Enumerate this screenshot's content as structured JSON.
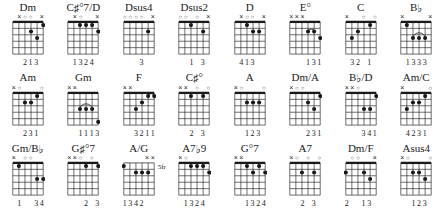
{
  "meta": {
    "doc_type": "guitar-chord-chart",
    "rows": 3,
    "cols": 8,
    "strings": 6,
    "frets": 5,
    "ink_color": "#1a1a1a",
    "background_color": "#ffffff"
  },
  "symbols": {
    "open": "○",
    "muted": "×",
    "dot": "●"
  },
  "chart_data": {
    "type": "table",
    "title": "",
    "chords": [
      {
        "name": "Dm",
        "name_parts": [
          {
            "t": "Dm",
            "k": "plain"
          }
        ],
        "position_label": "",
        "markers": [
          "n",
          "x",
          "o",
          "o",
          "n",
          "x"
        ],
        "dots": [
          {
            "string": 3,
            "fret": 2
          },
          {
            "string": 2,
            "fret": 3
          },
          {
            "string": 1,
            "fret": 1
          }
        ],
        "barres": [],
        "fingering": [
          "",
          "",
          "2",
          "1",
          "3",
          ""
        ]
      },
      {
        "name": "C#°7/D",
        "name_parts": [
          {
            "t": "C",
            "k": "plain"
          },
          {
            "t": "♯",
            "k": "acc"
          },
          {
            "t": "°7",
            "k": "plain"
          },
          {
            "t": "/D",
            "k": "plain"
          }
        ],
        "position_label": "",
        "markers": [
          "n",
          "x",
          "o",
          "n",
          "n",
          "x"
        ],
        "dots": [
          {
            "string": 4,
            "fret": 1
          },
          {
            "string": 3,
            "fret": 1
          },
          {
            "string": 2,
            "fret": 1
          },
          {
            "string": 1,
            "fret": 2
          }
        ],
        "barres": [],
        "fingering": [
          "",
          "1",
          "3",
          "2",
          "4",
          ""
        ]
      },
      {
        "name": "Dsus4",
        "name_parts": [
          {
            "t": "Dsus4",
            "k": "plain"
          }
        ],
        "position_label": "",
        "markers": [
          "o",
          "o",
          "o",
          "o",
          "n",
          "x"
        ],
        "dots": [
          {
            "string": 2,
            "fret": 2
          }
        ],
        "barres": [],
        "fingering": [
          "",
          "",
          "",
          "3",
          "",
          ""
        ]
      },
      {
        "name": "Dsus2",
        "name_parts": [
          {
            "t": "Dsus2",
            "k": "plain"
          }
        ],
        "position_label": "",
        "markers": [
          "o",
          "o",
          "n",
          "o",
          "n",
          "x"
        ],
        "dots": [
          {
            "string": 4,
            "fret": 1
          },
          {
            "string": 2,
            "fret": 2
          }
        ],
        "barres": [],
        "fingering": [
          "",
          "",
          "1",
          "",
          "3",
          ""
        ]
      },
      {
        "name": "D",
        "name_parts": [
          {
            "t": "D",
            "k": "plain"
          }
        ],
        "position_label": "",
        "markers": [
          "n",
          "x",
          "o",
          "o",
          "n",
          "x"
        ],
        "dots": [
          {
            "string": 4,
            "fret": 1
          },
          {
            "string": 3,
            "fret": 2
          },
          {
            "string": 2,
            "fret": 2
          }
        ],
        "barres": [],
        "fingering": [
          "",
          "4",
          "1",
          "3",
          "",
          ""
        ]
      },
      {
        "name": "E°",
        "name_parts": [
          {
            "t": "E",
            "k": "plain"
          },
          {
            "t": "°",
            "k": "plain"
          }
        ],
        "position_label": "",
        "markers": [
          "x",
          "x",
          "x",
          "n",
          "n",
          "n"
        ],
        "dots": [
          {
            "string": 3,
            "fret": 2
          },
          {
            "string": 2,
            "fret": 2
          },
          {
            "string": 1,
            "fret": 3
          }
        ],
        "barres": [
          {
            "fret": 2,
            "from": 3,
            "to": 2,
            "arc": true
          }
        ],
        "fingering": [
          "",
          "",
          "",
          "1",
          "3",
          "1"
        ]
      },
      {
        "name": "C",
        "name_parts": [
          {
            "t": "C",
            "k": "plain"
          }
        ],
        "position_label": "",
        "markers": [
          "x",
          "n",
          "n",
          "o",
          "n",
          "o"
        ],
        "dots": [
          {
            "string": 5,
            "fret": 3
          },
          {
            "string": 4,
            "fret": 2
          },
          {
            "string": 2,
            "fret": 1
          }
        ],
        "barres": [],
        "fingering": [
          "",
          "3",
          "2",
          "",
          "1",
          ""
        ]
      },
      {
        "name": "B♭",
        "name_parts": [
          {
            "t": "B",
            "k": "plain"
          },
          {
            "t": "♭",
            "k": "acc"
          }
        ],
        "position_label": "",
        "markers": [
          "x",
          "n",
          "n",
          "n",
          "n",
          "x"
        ],
        "dots": [
          {
            "string": 5,
            "fret": 1
          },
          {
            "string": 4,
            "fret": 3
          },
          {
            "string": 3,
            "fret": 3
          },
          {
            "string": 2,
            "fret": 3
          }
        ],
        "barres": [
          {
            "fret": 3,
            "from": 4,
            "to": 2,
            "arc": true
          }
        ],
        "fingering": [
          "",
          "1",
          "3",
          "3",
          "3",
          ""
        ]
      },
      {
        "name": "Am",
        "name_parts": [
          {
            "t": "Am",
            "k": "plain"
          }
        ],
        "position_label": "",
        "markers": [
          "x",
          "o",
          "n",
          "n",
          "n",
          "o"
        ],
        "dots": [
          {
            "string": 4,
            "fret": 2
          },
          {
            "string": 3,
            "fret": 2
          },
          {
            "string": 2,
            "fret": 1
          }
        ],
        "barres": [],
        "fingering": [
          "",
          "",
          "2",
          "3",
          "1",
          ""
        ]
      },
      {
        "name": "Gm",
        "name_parts": [
          {
            "t": "Gm",
            "k": "plain"
          }
        ],
        "position_label": "",
        "markers": [
          "x",
          "x",
          "n",
          "n",
          "n",
          "n"
        ],
        "dots": [
          {
            "string": 4,
            "fret": 3
          },
          {
            "string": 3,
            "fret": 3
          },
          {
            "string": 2,
            "fret": 3
          },
          {
            "string": 1,
            "fret": 5
          }
        ],
        "barres": [
          {
            "fret": 3,
            "from": 4,
            "to": 2,
            "arc": true
          }
        ],
        "fingering": [
          "",
          "",
          "1",
          "1",
          "1",
          "3"
        ]
      },
      {
        "name": "F",
        "name_parts": [
          {
            "t": "F",
            "k": "plain"
          }
        ],
        "position_label": "",
        "markers": [
          "x",
          "x",
          "n",
          "n",
          "n",
          "n"
        ],
        "dots": [
          {
            "string": 4,
            "fret": 3
          },
          {
            "string": 3,
            "fret": 2
          },
          {
            "string": 2,
            "fret": 1
          },
          {
            "string": 1,
            "fret": 1
          }
        ],
        "barres": [
          {
            "fret": 1,
            "from": 2,
            "to": 1,
            "arc": true
          }
        ],
        "fingering": [
          "",
          "",
          "3",
          "2",
          "1",
          "1"
        ]
      },
      {
        "name": "C#°",
        "name_parts": [
          {
            "t": "C",
            "k": "plain"
          },
          {
            "t": "♯",
            "k": "acc"
          },
          {
            "t": "°",
            "k": "plain"
          }
        ],
        "position_label": "",
        "markers": [
          "x",
          "x",
          "n",
          "o",
          "n",
          "o"
        ],
        "dots": [
          {
            "string": 4,
            "fret": 1
          },
          {
            "string": 2,
            "fret": 1
          }
        ],
        "barres": [],
        "fingering": [
          "",
          "",
          "2",
          "",
          "3",
          ""
        ]
      },
      {
        "name": "A",
        "name_parts": [
          {
            "t": "A",
            "k": "plain"
          }
        ],
        "position_label": "",
        "markers": [
          "x",
          "o",
          "n",
          "n",
          "n",
          "o"
        ],
        "dots": [
          {
            "string": 4,
            "fret": 2
          },
          {
            "string": 3,
            "fret": 2
          },
          {
            "string": 2,
            "fret": 2
          }
        ],
        "barres": [],
        "fingering": [
          "",
          "",
          "1",
          "2",
          "3",
          ""
        ]
      },
      {
        "name": "Dm/A",
        "name_parts": [
          {
            "t": "Dm/A",
            "k": "plain"
          }
        ],
        "position_label": "",
        "markers": [
          "x",
          "o",
          "o",
          "n",
          "n",
          "n"
        ],
        "dots": [
          {
            "string": 3,
            "fret": 2
          },
          {
            "string": 2,
            "fret": 3
          },
          {
            "string": 1,
            "fret": 1
          }
        ],
        "barres": [],
        "fingering": [
          "",
          "",
          "",
          "2",
          "3",
          "1"
        ]
      },
      {
        "name": "B♭/D",
        "name_parts": [
          {
            "t": "B",
            "k": "plain"
          },
          {
            "t": "♭",
            "k": "acc"
          },
          {
            "t": "/D",
            "k": "plain"
          }
        ],
        "position_label": "",
        "markers": [
          "x",
          "x",
          "o",
          "n",
          "n",
          "n"
        ],
        "dots": [
          {
            "string": 3,
            "fret": 3
          },
          {
            "string": 2,
            "fret": 3
          },
          {
            "string": 1,
            "fret": 1
          }
        ],
        "barres": [],
        "fingering": [
          "",
          "",
          "",
          "3",
          "4",
          "1"
        ]
      },
      {
        "name": "Am/C",
        "name_parts": [
          {
            "t": "Am/C",
            "k": "plain"
          }
        ],
        "position_label": "",
        "markers": [
          "x",
          "n",
          "n",
          "n",
          "n",
          "o"
        ],
        "dots": [
          {
            "string": 5,
            "fret": 3
          },
          {
            "string": 4,
            "fret": 2
          },
          {
            "string": 3,
            "fret": 2
          },
          {
            "string": 2,
            "fret": 1
          }
        ],
        "barres": [],
        "fingering": [
          "",
          "4",
          "2",
          "3",
          "1",
          ""
        ]
      },
      {
        "name": "Gm/B♭",
        "name_parts": [
          {
            "t": "Gm/B",
            "k": "plain"
          },
          {
            "t": "♭",
            "k": "acc"
          }
        ],
        "position_label": "",
        "markers": [
          "x",
          "n",
          "o",
          "o",
          "n",
          "n"
        ],
        "dots": [
          {
            "string": 5,
            "fret": 1
          },
          {
            "string": 2,
            "fret": 3
          },
          {
            "string": 1,
            "fret": 3
          }
        ],
        "barres": [],
        "fingering": [
          "",
          "1",
          "",
          "",
          "3",
          "4"
        ]
      },
      {
        "name": "G#°7",
        "name_parts": [
          {
            "t": "G",
            "k": "plain"
          },
          {
            "t": "♯",
            "k": "acc"
          },
          {
            "t": "°7",
            "k": "plain"
          }
        ],
        "position_label": "",
        "markers": [
          "x",
          "x",
          "o",
          "n",
          "o",
          "n"
        ],
        "dots": [
          {
            "string": 3,
            "fret": 1
          },
          {
            "string": 1,
            "fret": 1
          }
        ],
        "barres": [],
        "fingering": [
          "",
          "",
          "",
          "2",
          "",
          "3"
        ]
      },
      {
        "name": "A/G",
        "name_parts": [
          {
            "t": "A/G",
            "k": "plain"
          }
        ],
        "position_label": "5fr",
        "markers": [
          "n",
          "n",
          "n",
          "n",
          "x",
          "x"
        ],
        "dots": [
          {
            "string": 6,
            "fret": 1
          },
          {
            "string": 4,
            "fret": 2
          },
          {
            "string": 3,
            "fret": 2
          },
          {
            "string": 2,
            "fret": 2
          }
        ],
        "barres": [],
        "fingering": [
          "1",
          "3",
          "4",
          "2",
          "",
          ""
        ]
      },
      {
        "name": "A7♭9",
        "name_parts": [
          {
            "t": "A7",
            "k": "plain"
          },
          {
            "t": "♭",
            "k": "acc"
          },
          {
            "t": "9",
            "k": "plain"
          }
        ],
        "position_label": "",
        "markers": [
          "x",
          "o",
          "n",
          "n",
          "n",
          "n"
        ],
        "dots": [
          {
            "string": 4,
            "fret": 1
          },
          {
            "string": 3,
            "fret": 1
          },
          {
            "string": 2,
            "fret": 1
          },
          {
            "string": 1,
            "fret": 2
          }
        ],
        "barres": [],
        "fingering": [
          "",
          "1",
          "3",
          "2",
          "4",
          ""
        ]
      },
      {
        "name": "G°7",
        "name_parts": [
          {
            "t": "G",
            "k": "plain"
          },
          {
            "t": "°7",
            "k": "plain"
          }
        ],
        "position_label": "",
        "markers": [
          "x",
          "x",
          "n",
          "n",
          "n",
          "n"
        ],
        "dots": [
          {
            "string": 4,
            "fret": 1
          },
          {
            "string": 3,
            "fret": 2
          },
          {
            "string": 2,
            "fret": 1
          },
          {
            "string": 1,
            "fret": 2
          }
        ],
        "barres": [],
        "fingering": [
          "",
          "",
          "1",
          "3",
          "2",
          "4"
        ]
      },
      {
        "name": "A7",
        "name_parts": [
          {
            "t": "A7",
            "k": "plain"
          }
        ],
        "position_label": "",
        "markers": [
          "x",
          "o",
          "n",
          "o",
          "n",
          "o"
        ],
        "dots": [
          {
            "string": 4,
            "fret": 2
          },
          {
            "string": 2,
            "fret": 2
          }
        ],
        "barres": [],
        "fingering": [
          "",
          "",
          "2",
          "",
          "3",
          ""
        ]
      },
      {
        "name": "Dm/F",
        "name_parts": [
          {
            "t": "Dm/F",
            "k": "plain"
          }
        ],
        "position_label": "",
        "markers": [
          "n",
          "o",
          "o",
          "n",
          "n",
          "x"
        ],
        "dots": [
          {
            "string": 6,
            "fret": 2
          },
          {
            "string": 3,
            "fret": 2
          },
          {
            "string": 2,
            "fret": 3
          }
        ],
        "barres": [],
        "fingering": [
          "2",
          "",
          "",
          "1",
          "3",
          ""
        ]
      },
      {
        "name": "Asus4",
        "name_parts": [
          {
            "t": "Asus4",
            "k": "plain"
          }
        ],
        "position_label": "",
        "markers": [
          "x",
          "o",
          "n",
          "n",
          "n",
          "o"
        ],
        "dots": [
          {
            "string": 4,
            "fret": 2
          },
          {
            "string": 3,
            "fret": 2
          },
          {
            "string": 2,
            "fret": 3
          }
        ],
        "barres": [],
        "fingering": [
          "",
          "",
          "1",
          "2",
          "3",
          ""
        ]
      }
    ]
  }
}
